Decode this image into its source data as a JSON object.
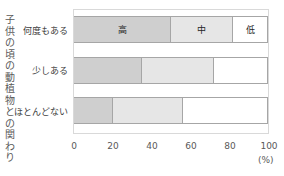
{
  "chart_data": {
    "type": "bar",
    "orientation": "horizontal",
    "stacked": true,
    "title": "",
    "ylabel": "子供の頃の動植物との関わり",
    "xlabel": "(%)",
    "categories": [
      "何度もある",
      "少しある",
      "ほとんどない"
    ],
    "series": [
      {
        "name": "高",
        "values": [
          50,
          35,
          20
        ],
        "color": "#cfcfcf"
      },
      {
        "name": "中",
        "values": [
          32,
          37,
          36
        ],
        "color": "#e6e6e6"
      },
      {
        "name": "低",
        "values": [
          18,
          28,
          44
        ],
        "color": "#ffffff"
      }
    ],
    "segment_labels_shown_on_first_bar": [
      "高",
      "中",
      "低"
    ],
    "xticks": [
      "0",
      "20",
      "40",
      "60",
      "80",
      "100"
    ],
    "xlim": [
      0,
      100
    ],
    "grid": false,
    "legend": "none (labels inside first bar)"
  },
  "ytitle_chars": [
    "子",
    "供",
    "の",
    "頃",
    "の",
    "動",
    "植",
    "物",
    "と",
    "の",
    "関",
    "わ",
    "り"
  ],
  "rows": [
    {
      "label": "何度もある",
      "high": 50,
      "mid": 32,
      "low": 18,
      "high_label": "高",
      "mid_label": "中",
      "low_label": "低"
    },
    {
      "label": "少しある",
      "high": 35,
      "mid": 37,
      "low": 28,
      "high_label": "",
      "mid_label": "",
      "low_label": ""
    },
    {
      "label": "ほとんどない",
      "high": 20,
      "mid": 36,
      "low": 44,
      "high_label": "",
      "mid_label": "",
      "low_label": ""
    }
  ],
  "xticks": [
    "0",
    "20",
    "40",
    "60",
    "80",
    "100"
  ],
  "unit": "(%)"
}
